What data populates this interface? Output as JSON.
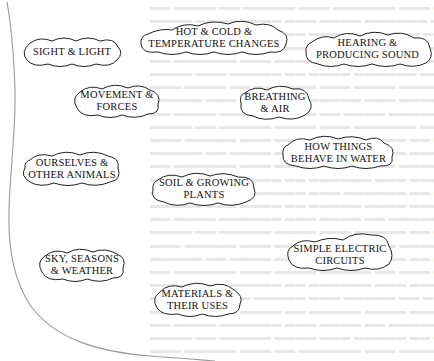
{
  "page": {
    "background": "#ffffff",
    "ink_color": "#111111",
    "edge_color": "#9a9a9a"
  },
  "topics": [
    {
      "id": "sight-light",
      "lines": [
        "SIGHT & LIGHT"
      ]
    },
    {
      "id": "hot-cold",
      "lines": [
        "HOT & COLD &",
        "TEMPERATURE CHANGES"
      ]
    },
    {
      "id": "hearing",
      "lines": [
        "HEARING &",
        "PRODUCING SOUND"
      ]
    },
    {
      "id": "movement",
      "lines": [
        "MOVEMENT &",
        "FORCES"
      ]
    },
    {
      "id": "breathing",
      "lines": [
        "BREATHING",
        "& AIR"
      ]
    },
    {
      "id": "water",
      "lines": [
        "HOW THINGS",
        "BEHAVE IN WATER"
      ]
    },
    {
      "id": "ourselves",
      "lines": [
        "OURSELVES &",
        "OTHER ANIMALS"
      ]
    },
    {
      "id": "soil",
      "lines": [
        "SOIL & GROWING",
        "PLANTS"
      ]
    },
    {
      "id": "sky",
      "lines": [
        "SKY, SEASONS",
        "& WEATHER"
      ]
    },
    {
      "id": "electric",
      "lines": [
        "SIMPLE ELECTRIC",
        "CIRCUITS"
      ]
    },
    {
      "id": "materials",
      "lines": [
        "MATERIALS &",
        "THEIR USES"
      ]
    }
  ]
}
